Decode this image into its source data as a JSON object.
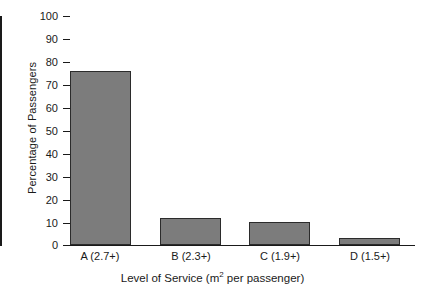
{
  "chart_data": {
    "type": "bar",
    "title": "",
    "subtitle": "",
    "xlabel_parts": {
      "before": "Level of Service (m",
      "superscript": "2",
      "after": " per passenger)"
    },
    "xlabel": "Level of Service (m2 per passenger)",
    "ylabel": "Percentage of Passengers",
    "categories": [
      "A (2.7+)",
      "B (2.3+)",
      "C (1.9+)",
      "D (1.5+)"
    ],
    "values": [
      76,
      12,
      10,
      3
    ],
    "ylim": [
      0,
      100
    ],
    "ytick_labels": [
      "100",
      "90",
      "80",
      "70",
      "60",
      "50",
      "40",
      "30",
      "20",
      "10",
      "0"
    ],
    "ytick_values": [
      100,
      90,
      80,
      70,
      60,
      50,
      40,
      30,
      20,
      10,
      0
    ],
    "grid": false,
    "legend": false,
    "legend_position": "none",
    "bar_fill_color": "#7c7c7c",
    "bar_edge_color": "#2b2b2b",
    "axis_color": "#1a1a1a",
    "background_color": "#ffffff"
  }
}
